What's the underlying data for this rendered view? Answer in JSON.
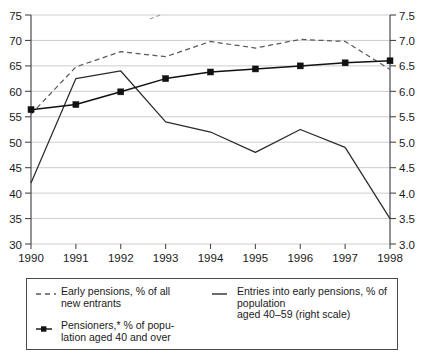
{
  "chart_data": {
    "type": "line",
    "title": "",
    "subtitle": "",
    "xlabel": "",
    "ylabel": "",
    "grid": true,
    "legend_position": "bottom",
    "x": [
      1990,
      1991,
      1992,
      1993,
      1994,
      1995,
      1996,
      1997,
      1998
    ],
    "categories": [
      "1990",
      "1991",
      "1992",
      "1993",
      "1994",
      "1995",
      "1996",
      "1997",
      "1998"
    ],
    "axes": {
      "left": {
        "label": "",
        "ylim": [
          30,
          75
        ],
        "ticks": [
          30,
          35,
          40,
          45,
          50,
          55,
          60,
          65,
          70,
          75
        ],
        "tick_labels": [
          "30",
          "35",
          "40",
          "45",
          "50",
          "55",
          "60",
          "65",
          "70",
          "75"
        ]
      },
      "right": {
        "label": "right scale",
        "ylim": [
          3.0,
          7.5
        ],
        "ticks": [
          3.0,
          3.5,
          4.0,
          4.5,
          5.0,
          5.5,
          6.0,
          6.5,
          7.0,
          7.5
        ],
        "tick_labels": [
          "3.0",
          "3.5",
          "4.0",
          "4.5",
          "5.0",
          "5.5",
          "6.0",
          "6.5",
          "7.0",
          "7.5"
        ]
      },
      "x": {
        "label": "",
        "tick_labels": [
          "1990",
          "1991",
          "1992",
          "1993",
          "1994",
          "1995",
          "1996",
          "1997",
          "1998"
        ]
      }
    },
    "series": [
      {
        "name": "Early pensions, % of all new entrants",
        "axis": "left",
        "style": "dashed",
        "marker": "none",
        "color": "#5a5a5a",
        "values": [
          55.5,
          64.8,
          67.8,
          66.8,
          69.8,
          68.5,
          70.2,
          69.8,
          64.3
        ]
      },
      {
        "name": "Entries into early pensions, % of population aged 40–59 (right scale)",
        "axis": "right",
        "style": "solid",
        "marker": "none",
        "color": "#2b2b2b",
        "values": [
          4.2,
          6.25,
          6.4,
          5.4,
          5.2,
          4.8,
          5.25,
          4.9,
          3.5
        ]
      },
      {
        "name": "Pensioners,* % of population aged 40 and over",
        "axis": "left",
        "style": "solid",
        "marker": "square",
        "color": "#111111",
        "values": [
          56.4,
          57.4,
          59.9,
          62.5,
          63.8,
          64.4,
          65.0,
          65.6,
          66.0
        ]
      }
    ],
    "annotations": []
  },
  "legend": {
    "entries": [
      {
        "id": "early-pensions",
        "swatch": "dashed-line",
        "label": "Early pensions, % of all\nnew entrants"
      },
      {
        "id": "entries-into-early-pensions",
        "swatch": "solid-line",
        "label": "Entries into early pensions, % of population\naged 40–59 (right scale)"
      },
      {
        "id": "pensioners",
        "swatch": "solid-line-square-marker",
        "label": "Pensioners,* % of popu-\nlation aged 40 and over"
      }
    ]
  },
  "colors": {
    "background": "#ffffff",
    "axis": "#4a4a4a",
    "gridline": "#b9b9b9",
    "dashed_series": "#5a5a5a",
    "thin_series": "#2b2b2b",
    "marked_series": "#111111"
  }
}
